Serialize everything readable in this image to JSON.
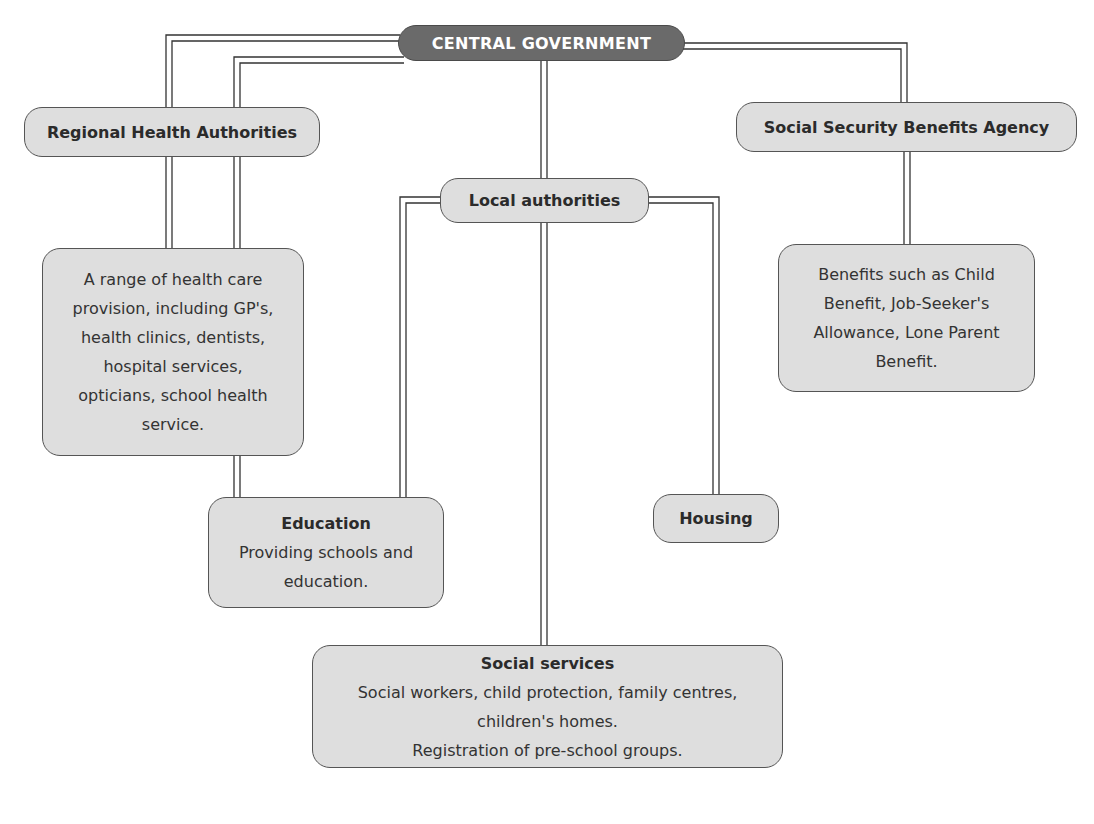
{
  "diagram": {
    "type": "organisation-chart",
    "root": {
      "label": "CENTRAL GOVERNMENT"
    },
    "nodes": {
      "regional_health": {
        "label": "Regional Health Authorities"
      },
      "health_provision": {
        "lines": [
          "A range of health care",
          "provision, including GP's,",
          "health clinics, dentists,",
          "hospital services,",
          "opticians, school health",
          "service."
        ]
      },
      "social_security": {
        "label": "Social Security Benefits Agency"
      },
      "benefits": {
        "lines": [
          "Benefits such as Child",
          "Benefit, Job-Seeker's",
          "Allowance, Lone Parent",
          "Benefit."
        ]
      },
      "local_authorities": {
        "label": "Local authorities"
      },
      "education": {
        "title": "Education",
        "lines": [
          "Providing schools and",
          "education."
        ]
      },
      "housing": {
        "label": "Housing"
      },
      "social_services": {
        "title": "Social services",
        "lines": [
          "Social workers, child protection, family centres,",
          "children's homes.",
          "Registration of pre-school groups."
        ]
      }
    },
    "edges": [
      [
        "CENTRAL GOVERNMENT",
        "Regional Health Authorities"
      ],
      [
        "CENTRAL GOVERNMENT",
        "Social Security Benefits Agency"
      ],
      [
        "CENTRAL GOVERNMENT",
        "Local authorities"
      ],
      [
        "CENTRAL GOVERNMENT",
        "Education"
      ],
      [
        "Regional Health Authorities",
        "A range of health care provision"
      ],
      [
        "Social Security Benefits Agency",
        "Benefits such as Child Benefit"
      ],
      [
        "Local authorities",
        "Education"
      ],
      [
        "Local authorities",
        "Housing"
      ],
      [
        "Local authorities",
        "Social services"
      ]
    ],
    "colors": {
      "root_fill": "#6a6a6a",
      "node_fill": "#dedede",
      "border": "#555555",
      "connector": "#333333"
    }
  }
}
